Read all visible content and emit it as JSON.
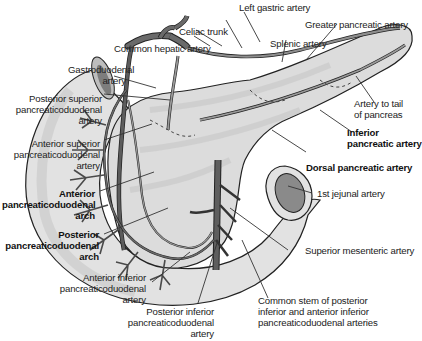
{
  "figure": {
    "colors": {
      "organ_fill": "#e4e4e4",
      "organ_shade": "#cfcfcf",
      "vessel_dark": "#555555",
      "vessel_light": "#9a9a9a",
      "outline": "#222222",
      "label_text": "#222222",
      "leader_line": "#333333"
    },
    "labels": {
      "left_gastric": "Left gastric artery",
      "celiac_trunk": "Celiac trunk",
      "greater_pancreatic": "Greater pancreatic artery",
      "common_hepatic": "Common hepatic artery",
      "splenic": "Splenic artery",
      "gastroduodenal": [
        "Gastroduodenal",
        "artery"
      ],
      "posterior_superior_pd": [
        "Posterior superior",
        "pancreaticoduodenal",
        "artery"
      ],
      "artery_to_tail": [
        "Artery to tail",
        "of pancreas"
      ],
      "inferior_pancreatic": [
        "Inferior",
        "pancreatic artery"
      ],
      "anterior_superior_pd": [
        "Anterior superior",
        "pancreaticoduodenal",
        "artery"
      ],
      "dorsal_pancreatic": "Dorsal pancreatic artery",
      "first_jejunal": "1st jejunal artery",
      "anterior_pd_arch": [
        "Anterior",
        "pancreaticoduodenal",
        "arch"
      ],
      "posterior_pd_arch": [
        "Posterior",
        "pancreaticoduodenal",
        "arch"
      ],
      "superior_mesenteric": "Superior mesenteric artery",
      "anterior_inferior_pd": [
        "Anterior inferior",
        "pancreaticoduodenal",
        "artery"
      ],
      "posterior_inferior_pd": [
        "Posterior inferior",
        "pancreaticoduodenal",
        "artery"
      ],
      "common_stem": [
        "Common stem of posterior",
        "inferior and anterior inferior",
        "pancreaticoduodenal arteries"
      ]
    },
    "bold_labels": [
      "inferior_pancreatic",
      "dorsal_pancreatic",
      "anterior_pd_arch",
      "posterior_pd_arch"
    ]
  }
}
